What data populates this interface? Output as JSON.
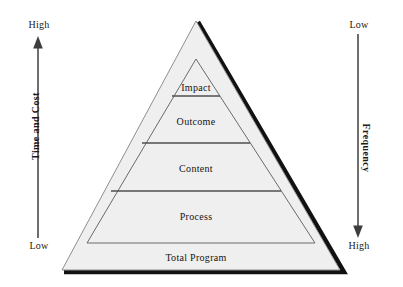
{
  "figure": {
    "background_color": "#ffffff",
    "width": 403,
    "height": 287
  },
  "pyramid": {
    "fill_color": "#efefef",
    "outline_color": "#8a8a8a",
    "shadow_color": "#111111",
    "divider_color": "#555555",
    "tiers": [
      {
        "label": "Impact"
      },
      {
        "label": "Outcome"
      },
      {
        "label": "Content"
      },
      {
        "label": "Process"
      }
    ],
    "base_label": "Total Program"
  },
  "left_axis": {
    "title": "Time and Cost",
    "top_label": "High",
    "bottom_label": "Low",
    "direction": "up",
    "line_color": "#4a4a4a"
  },
  "right_axis": {
    "title": "Frequency",
    "top_label": "Low",
    "bottom_label": "High",
    "direction": "down",
    "line_color": "#4a4a4a"
  }
}
